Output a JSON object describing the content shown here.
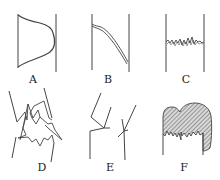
{
  "figure": {
    "panels": [
      {
        "id": "A",
        "label": "A",
        "description": "smooth profile curve between two vertical walls, bulging toward right wall"
      },
      {
        "id": "B",
        "label": "B",
        "description": "double-line curve descending from left wall to bottom of right wall"
      },
      {
        "id": "C",
        "label": "C",
        "description": "fluctuating wavy horizontal line between two vertical walls"
      },
      {
        "id": "D",
        "label": "D",
        "description": "chaotic jagged zigzag lines crossing between two diverging walls"
      },
      {
        "id": "E",
        "label": "E",
        "description": "two branching line structures with angled segments"
      },
      {
        "id": "F",
        "label": "F",
        "description": "hatched filled mushroom-like shape with irregular lower edge between two walls"
      }
    ],
    "colors": {
      "ink": "#333333",
      "background": "#ffffff",
      "hatch_fill": "#b0b0b0"
    }
  }
}
